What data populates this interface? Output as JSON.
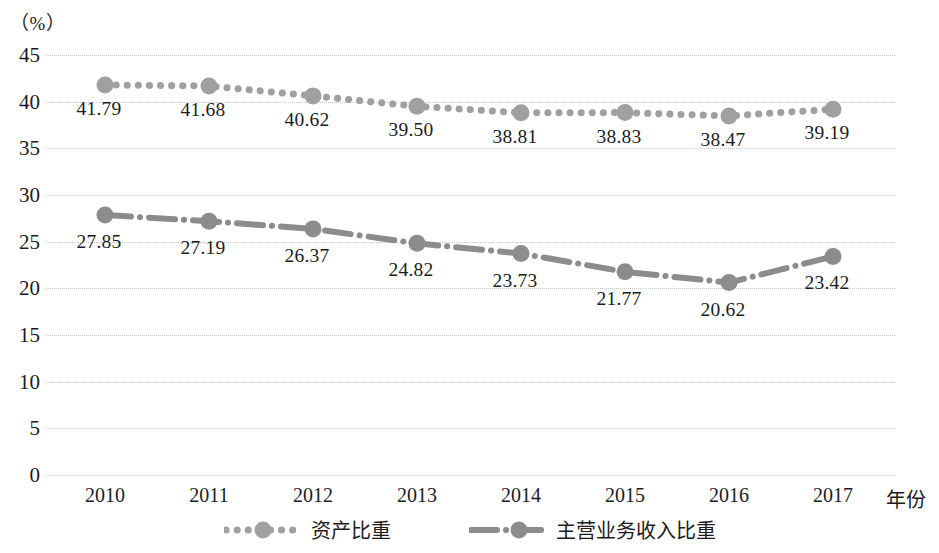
{
  "chart_data": {
    "type": "line",
    "title": "",
    "xlabel": "年份",
    "ylabel": "（%）",
    "categories": [
      "2010",
      "2011",
      "2012",
      "2013",
      "2014",
      "2015",
      "2016",
      "2017"
    ],
    "ylim": [
      0,
      45
    ],
    "yticks": [
      "0",
      "5",
      "10",
      "15",
      "20",
      "25",
      "30",
      "35",
      "40",
      "45"
    ],
    "grid": true,
    "legend_position": "bottom",
    "series": [
      {
        "name": "资产比重",
        "style": "dotted",
        "color": "#a0a0a0",
        "marker": "circle",
        "values": [
          41.79,
          41.68,
          40.62,
          39.5,
          38.81,
          38.83,
          38.47,
          39.19
        ],
        "labels": [
          "41.79",
          "41.68",
          "40.62",
          "39.50",
          "38.81",
          "38.83",
          "38.47",
          "39.19"
        ]
      },
      {
        "name": "主营业务收入比重",
        "style": "dash-dot",
        "color": "#8c8c8c",
        "marker": "circle",
        "values": [
          27.85,
          27.19,
          26.37,
          24.82,
          23.73,
          21.77,
          20.62,
          23.42
        ],
        "labels": [
          "27.85",
          "27.19",
          "26.37",
          "24.82",
          "23.73",
          "21.77",
          "20.62",
          "23.42"
        ]
      }
    ]
  },
  "axis": {
    "unit_label": "（%）",
    "x_title": "年份"
  },
  "legend": {
    "items": [
      {
        "label": "资产比重"
      },
      {
        "label": "主营业务收入比重"
      }
    ]
  },
  "colors": {
    "gridline": "#c9c9c9",
    "series_1": "#a0a0a0",
    "series_2": "#8c8c8c",
    "text": "#1b1b1b",
    "background": "#ffffff"
  }
}
